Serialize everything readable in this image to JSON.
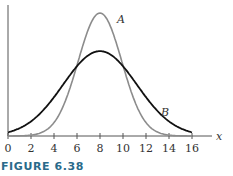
{
  "chart_data": {
    "type": "line",
    "title": "",
    "xlabel": "x",
    "ylabel": "",
    "xlim": [
      0,
      16
    ],
    "x_ticks": [
      0,
      2,
      4,
      6,
      8,
      10,
      12,
      14,
      16
    ],
    "grid": false,
    "legend": "inline labels",
    "series": [
      {
        "name": "A",
        "description": "narrow normal-like curve centered at 8, taller peak",
        "mean": 8,
        "sd": 1.9,
        "relative_peak": 1.0,
        "color": "#8c8c8c",
        "x": [
          0,
          2,
          4,
          5,
          6,
          7,
          8,
          9,
          10,
          11,
          12,
          14,
          16
        ],
        "y": [
          0.0,
          0.01,
          0.11,
          0.29,
          0.58,
          0.87,
          1.0,
          0.87,
          0.58,
          0.29,
          0.11,
          0.01,
          0.0
        ]
      },
      {
        "name": "B",
        "description": "wider normal-like curve centered at 8, lower peak",
        "mean": 8,
        "sd": 3.2,
        "relative_peak": 0.69,
        "color": "#111111",
        "x": [
          0,
          2,
          4,
          6,
          8,
          10,
          12,
          14,
          16
        ],
        "y": [
          0.03,
          0.12,
          0.32,
          0.56,
          0.69,
          0.56,
          0.32,
          0.12,
          0.03
        ]
      }
    ],
    "annotations": [
      "A",
      "B"
    ]
  },
  "axis": {
    "x_label": "x",
    "ticks": [
      "0",
      "2",
      "4",
      "6",
      "8",
      "10",
      "12",
      "14",
      "16"
    ]
  },
  "labels": {
    "curve_a": "A",
    "curve_b": "B"
  },
  "caption": "FIGURE 6.38"
}
